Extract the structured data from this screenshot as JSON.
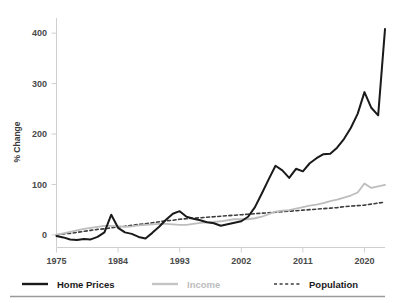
{
  "chart_data": {
    "type": "line",
    "title": "",
    "subtitle": "",
    "xlabel": "",
    "ylabel": "% Change",
    "xlim": [
      1975,
      2023
    ],
    "ylim": [
      -25,
      430
    ],
    "grid": false,
    "legend_position": "bottom",
    "x_ticks": [
      "1975",
      "1984",
      "1993",
      "2002",
      "2011",
      "2020"
    ],
    "x_tick_values": [
      1975,
      1984,
      1993,
      2002,
      2011,
      2020
    ],
    "y_ticks": [
      "0",
      "100",
      "200",
      "300",
      "400"
    ],
    "y_tick_values": [
      0,
      100,
      200,
      300,
      400
    ],
    "x": [
      1975,
      1976,
      1977,
      1978,
      1979,
      1980,
      1981,
      1982,
      1983,
      1984,
      1985,
      1986,
      1987,
      1988,
      1989,
      1990,
      1991,
      1992,
      1993,
      1994,
      1995,
      1996,
      1997,
      1998,
      1999,
      2000,
      2001,
      2002,
      2003,
      2004,
      2005,
      2006,
      2007,
      2008,
      2009,
      2010,
      2011,
      2012,
      2013,
      2014,
      2015,
      2016,
      2017,
      2018,
      2019,
      2020,
      2021,
      2022,
      2023
    ],
    "series": [
      {
        "name": "Home Prices",
        "color": "#1a1a1a",
        "style": "solid",
        "width": 2.0,
        "values": [
          -2,
          -5,
          -9,
          -10,
          -8,
          -9,
          -4,
          5,
          40,
          14,
          5,
          2,
          -4,
          -7,
          4,
          16,
          30,
          42,
          47,
          36,
          32,
          29,
          25,
          23,
          18,
          21,
          24,
          27,
          36,
          55,
          82,
          110,
          137,
          128,
          113,
          131,
          126,
          142,
          152,
          160,
          161,
          173,
          190,
          212,
          240,
          283,
          252,
          237,
          408
        ]
      },
      {
        "name": "Income",
        "color": "#bdbdbd",
        "style": "solid",
        "width": 1.8,
        "values": [
          0,
          3,
          6,
          9,
          12,
          14,
          16,
          18,
          18,
          17,
          16,
          17,
          19,
          20,
          21,
          22,
          22,
          21,
          20,
          20,
          22,
          24,
          25,
          26,
          27,
          29,
          31,
          31,
          31,
          33,
          36,
          41,
          46,
          48,
          49,
          52,
          55,
          58,
          60,
          63,
          67,
          70,
          74,
          78,
          84,
          102,
          93,
          96,
          99
        ]
      },
      {
        "name": "Population",
        "color": "#3d3d3d",
        "style": "dashed",
        "width": 1.6,
        "values": [
          0,
          2,
          3,
          5,
          7,
          9,
          11,
          12,
          14,
          16,
          17,
          19,
          21,
          22,
          24,
          26,
          28,
          29,
          31,
          32,
          33,
          34,
          35,
          36,
          37,
          38,
          39,
          40,
          41,
          42,
          43,
          44,
          45,
          46,
          47,
          48,
          49,
          50,
          51,
          52,
          53,
          54,
          56,
          57,
          58,
          59,
          61,
          63,
          65
        ]
      }
    ],
    "notable_points": {
      "home_prices_peak_value": 408,
      "home_prices_peak_year": 2023,
      "home_prices_bubble_peak_value": 137,
      "home_prices_bubble_peak_year": 2007,
      "income_end_value": 99,
      "population_end_value": 65
    }
  },
  "legend": {
    "items": [
      {
        "label": "Home Prices",
        "color": "#1a1a1a",
        "text_color": "#1a1a1a",
        "style": "solid"
      },
      {
        "label": "Income",
        "color": "#c4c4c4",
        "text_color": "#bdbdbd",
        "style": "solid"
      },
      {
        "label": "Population",
        "color": "#6b6b6b",
        "text_color": "#1a1a1a",
        "style": "dashed"
      }
    ]
  },
  "axes": {
    "y_title": "% Change"
  },
  "colors": {
    "background": "#ffffff",
    "axis_line": "#cfcfcf",
    "tick_label": "#4a4a4a",
    "footer_rule": "#9a9a9a"
  }
}
